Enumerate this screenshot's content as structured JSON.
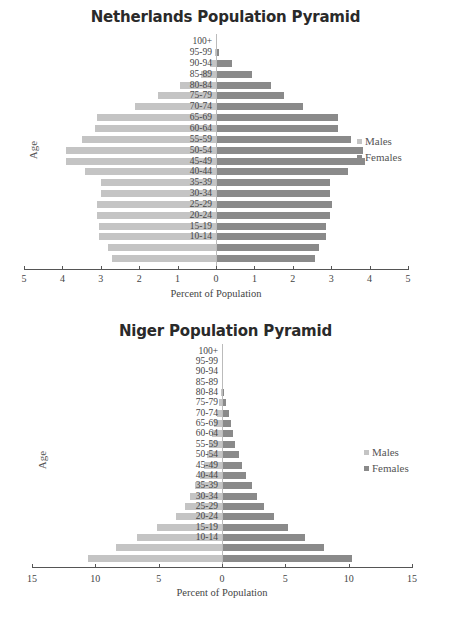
{
  "chart_data": [
    {
      "type": "bar",
      "orientation": "horizontal",
      "title": "Netherlands Population Pyramid",
      "xlabel": "Percent of Population",
      "ylabel": "Age",
      "xlim": [
        -5,
        5
      ],
      "x_ticks": [
        "5",
        "4",
        "3",
        "2",
        "1",
        "0",
        "1",
        "2",
        "3",
        "4",
        "5"
      ],
      "legend": [
        "Males",
        "Females"
      ],
      "legend_position": "right",
      "categories": [
        "0-4",
        "5-9",
        "10-14",
        "15-19",
        "20-24",
        "25-29",
        "30-34",
        "35-39",
        "40-44",
        "45-49",
        "50-54",
        "55-59",
        "60-64",
        "65-69",
        "70-74",
        "75-79",
        "80-84",
        "85-89",
        "90-94",
        "95-99",
        "100+"
      ],
      "category_labels_visible": [
        "",
        "",
        "10-14",
        "15-19",
        "20-24",
        "25-29",
        "30-34",
        "35-39",
        "40-44",
        "45-49",
        "50-54",
        "55-59",
        "60-64",
        "65-69",
        "70-74",
        "75-79",
        "80-84",
        "85-89",
        "90-94",
        "95-99",
        "100+"
      ],
      "series": [
        {
          "name": "Males",
          "color": "#c4c4c4",
          "values": [
            2.7,
            2.8,
            3.05,
            3.05,
            3.1,
            3.1,
            3.0,
            3.0,
            3.4,
            3.9,
            3.9,
            3.5,
            3.15,
            3.1,
            2.1,
            1.5,
            0.95,
            0.4,
            0.15,
            0.02,
            0.0
          ]
        },
        {
          "name": "Females",
          "color": "#8a8a8a",
          "values": [
            2.55,
            2.65,
            2.85,
            2.85,
            2.95,
            3.0,
            2.95,
            2.95,
            3.4,
            3.85,
            3.8,
            3.5,
            3.15,
            3.15,
            2.25,
            1.75,
            1.4,
            0.9,
            0.4,
            0.06,
            0.0
          ]
        }
      ]
    },
    {
      "type": "bar",
      "orientation": "horizontal",
      "title": "Niger Population Pyramid",
      "xlabel": "Percent of Population",
      "ylabel": "Age",
      "xlim": [
        -15,
        15
      ],
      "x_ticks": [
        "15",
        "10",
        "5",
        "0",
        "5",
        "10",
        "15"
      ],
      "legend": [
        "Males",
        "Females"
      ],
      "legend_position": "right",
      "categories": [
        "0-4",
        "5-9",
        "10-14",
        "15-19",
        "20-24",
        "25-29",
        "30-34",
        "35-39",
        "40-44",
        "45-49",
        "50-54",
        "55-59",
        "60-64",
        "65-69",
        "70-74",
        "75-79",
        "80-84",
        "85-89",
        "90-94",
        "95-99",
        "100+"
      ],
      "category_labels_visible": [
        "",
        "",
        "10-14",
        "15-19",
        "20-24",
        "25-29",
        "30-34",
        "35-39",
        "40-44",
        "45-49",
        "50-54",
        "55-59",
        "60-64",
        "65-69",
        "70-74",
        "75-79",
        "80-84",
        "85-89",
        "90-94",
        "95-99",
        "100+"
      ],
      "series": [
        {
          "name": "Males",
          "color": "#c4c4c4",
          "values": [
            10.6,
            8.4,
            6.7,
            5.1,
            3.6,
            2.9,
            2.5,
            2.1,
            1.7,
            1.4,
            1.2,
            1.0,
            0.8,
            0.6,
            0.4,
            0.2,
            0.1,
            0.0,
            0.0,
            0.0,
            0.0
          ]
        },
        {
          "name": "Females",
          "color": "#8a8a8a",
          "values": [
            10.2,
            8.0,
            6.5,
            5.1,
            4.0,
            3.2,
            2.7,
            2.3,
            1.8,
            1.5,
            1.3,
            0.95,
            0.75,
            0.65,
            0.5,
            0.2,
            0.1,
            0.0,
            0.0,
            0.0,
            0.0
          ]
        }
      ]
    }
  ]
}
